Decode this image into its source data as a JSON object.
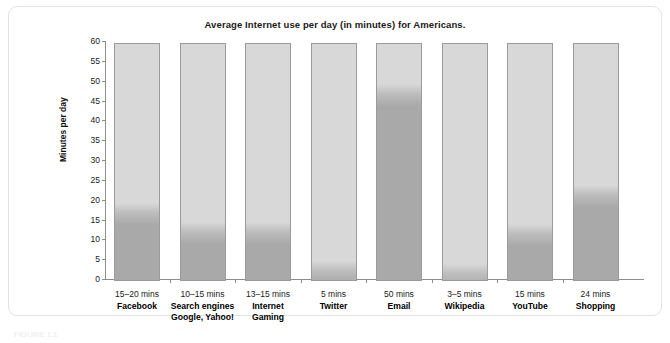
{
  "figure": {
    "caption": "FIGURE 1.1"
  },
  "chart_data": {
    "type": "bar",
    "title": "Average Internet use per day (in minutes) for Americans.",
    "xlabel": "",
    "ylabel": "Minutes per day",
    "ylim": [
      0,
      60
    ],
    "yticks": [
      0,
      5,
      10,
      15,
      20,
      25,
      30,
      35,
      40,
      45,
      50,
      55,
      60
    ],
    "grid": false,
    "legend": "none",
    "categories": [
      "Facebook",
      "Search engines",
      "Internet",
      "Twitter",
      "Email",
      "Wikipedia",
      "YouTube",
      "Shopping"
    ],
    "values": [
      19.5,
      14.5,
      14.5,
      4.8,
      49.5,
      4.0,
      14.0,
      24.0
    ],
    "points": [
      {
        "label_value": "15–20 mins",
        "label_name": "Facebook",
        "label_name2": "",
        "value": 19.5,
        "range_low": 15,
        "range_high": 20
      },
      {
        "label_value": "10–15 mins",
        "label_name": "Search engines",
        "label_name2": "Google, Yahoo!",
        "value": 14.5,
        "range_low": 10,
        "range_high": 15
      },
      {
        "label_value": "13–15 mins",
        "label_name": "Internet",
        "label_name2": "Gaming",
        "value": 14.5,
        "range_low": 13,
        "range_high": 15
      },
      {
        "label_value": "5 mins",
        "label_name": "Twitter",
        "label_name2": "",
        "value": 4.8,
        "range_low": 5,
        "range_high": 5
      },
      {
        "label_value": "50 mins",
        "label_name": "Email",
        "label_name2": "",
        "value": 49.5,
        "range_low": 50,
        "range_high": 50
      },
      {
        "label_value": "3–5 mins",
        "label_name": "Wikipedia",
        "label_name2": "",
        "value": 4.0,
        "range_low": 3,
        "range_high": 5
      },
      {
        "label_value": "15 mins",
        "label_name": "YouTube",
        "label_name2": "",
        "value": 14.0,
        "range_low": 15,
        "range_high": 15
      },
      {
        "label_value": "24 mins",
        "label_name": "Shopping",
        "label_name2": "",
        "value": 24.0,
        "range_low": 24,
        "range_high": 24
      }
    ],
    "colors": {
      "bar_background": "#d8d8d8",
      "bar_fill": "#a9a9a9",
      "bar_border": "#9b9b9b",
      "axis": "#8c8c8c",
      "text": "#1a1a1a"
    }
  }
}
